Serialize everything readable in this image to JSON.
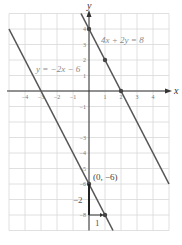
{
  "chart_data": {
    "type": "line",
    "title": "",
    "xlabel": "x",
    "ylabel": "y",
    "xlim": [
      -5,
      5
    ],
    "ylim": [
      -9,
      5
    ],
    "grid": true,
    "x_ticks": [
      -4,
      -3,
      -2,
      -1,
      1,
      2,
      3,
      4
    ],
    "y_ticks": [
      4,
      3,
      2,
      1,
      -1,
      -3,
      -4,
      -5,
      -6,
      -8
    ],
    "series": [
      {
        "name": "4x + 2y = 8",
        "equation": "y = -2x + 4",
        "slope": -2,
        "intercept": 4,
        "x_range": [
          -0.5,
          5
        ],
        "points": [
          [
            0,
            4
          ],
          [
            1,
            2
          ],
          [
            2,
            0
          ]
        ]
      },
      {
        "name": "y = -2x - 6",
        "equation": "y = -2x - 6",
        "slope": -2,
        "intercept": -6,
        "x_range": [
          -5,
          1.5
        ],
        "points": [
          [
            0,
            -6
          ],
          [
            1,
            -8
          ]
        ]
      }
    ],
    "annotations": [
      {
        "text": "4x + 2y = 8",
        "x": 0.7,
        "y": 4.3
      },
      {
        "text": "y = −2x − 6",
        "x": -4.3,
        "y": 1.8
      },
      {
        "text": "(0, −6)",
        "x": 0.35,
        "y": -5.6
      },
      {
        "text": "−2",
        "x": -0.95,
        "y": -7.0,
        "role": "rise"
      },
      {
        "text": "1",
        "x": 0.45,
        "y": -8.7,
        "role": "run"
      }
    ]
  },
  "labels": {
    "x_axis": "x",
    "y_axis": "y",
    "line1": "4x + 2y = 8",
    "line2": "y = −2x − 6",
    "point": "(0, −6)",
    "rise": "−2",
    "run": "1",
    "tick_x": [
      "−4",
      "−3",
      "−2",
      "−1",
      "1",
      "2",
      "3",
      "4"
    ],
    "tick_y_pos": [
      "4",
      "3",
      "2",
      "1"
    ],
    "tick_y_neg": [
      "−1",
      "−3",
      "−4",
      "−5",
      "−6",
      "−8"
    ]
  },
  "colors": {
    "grid": "#d8d8d8",
    "axis": "#333333",
    "line": "#555555",
    "point": "#444444",
    "label": "#777777"
  }
}
